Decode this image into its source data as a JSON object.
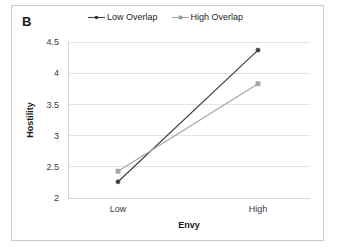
{
  "figure": {
    "panel_label": "B",
    "background_color": "#ffffff",
    "frame_color": "#c9c9c9"
  },
  "legend": {
    "position": "top-center",
    "entries": [
      {
        "label": "Low Overlap",
        "color": "#404040",
        "marker": "circle",
        "swatch_name": "legend-swatch-low-overlap"
      },
      {
        "label": "High Overlap",
        "color": "#a6a6a6",
        "marker": "square",
        "swatch_name": "legend-swatch-high-overlap"
      }
    ]
  },
  "chart_data": {
    "type": "line",
    "title": "",
    "xlabel": "Envy",
    "ylabel": "Hostility",
    "categories": [
      "Low",
      "High"
    ],
    "series": [
      {
        "name": "Low Overlap",
        "values": [
          2.26,
          4.37
        ],
        "color": "#404040",
        "marker": "circle"
      },
      {
        "name": "High Overlap",
        "values": [
          2.43,
          3.83
        ],
        "color": "#a6a6a6",
        "marker": "square"
      }
    ],
    "ylim": [
      2,
      4.5
    ],
    "yticks": [
      2,
      2.5,
      3,
      3.5,
      4,
      4.5
    ],
    "ytick_labels": [
      "2",
      "2.5",
      "3",
      "3.5",
      "4",
      "4.5"
    ],
    "xtick_labels": [
      "Low",
      "High"
    ],
    "grid": true,
    "grid_axis": "y",
    "legend_position": "top-center"
  },
  "plot_geometry": {
    "left": 68,
    "right": 310,
    "top": 42,
    "bottom": 198,
    "x_positions": [
      118,
      258
    ]
  }
}
